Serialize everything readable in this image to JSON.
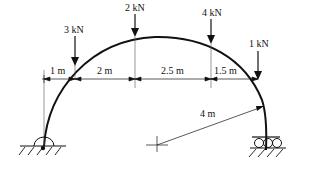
{
  "diagram": {
    "type": "structural-arch",
    "loads": [
      {
        "label": "3 kN",
        "x": 75,
        "yTop": 36,
        "yBot": 65
      },
      {
        "label": "2 kN",
        "x": 135,
        "yTop": 14,
        "yBot": 37
      },
      {
        "label": "4 kN",
        "x": 211,
        "yTop": 18,
        "yBot": 44
      },
      {
        "label": "1 kN",
        "x": 258,
        "yTop": 50,
        "yBot": 80
      }
    ],
    "dimensions": [
      {
        "label": "1 m",
        "x1": 44,
        "x2": 75
      },
      {
        "label": "2 m",
        "x1": 75,
        "x2": 135
      },
      {
        "label": "2.5 m",
        "x1": 135,
        "x2": 211
      },
      {
        "label": "1.5 m",
        "x1": 211,
        "x2": 258
      }
    ],
    "radius": {
      "label": "4 m"
    },
    "supports": {
      "left": "pin-support",
      "right": "roller-support"
    },
    "colors": {
      "stroke": "#111111",
      "background": "#ffffff"
    }
  }
}
